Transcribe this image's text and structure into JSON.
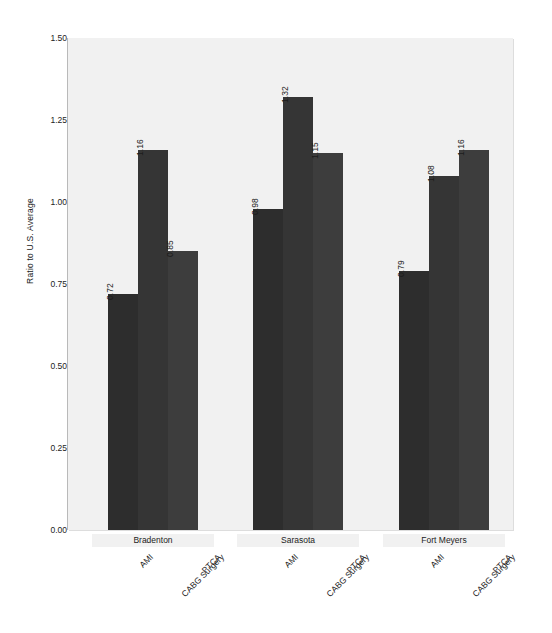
{
  "chart_data": {
    "type": "bar",
    "title": "",
    "xlabel": "",
    "ylabel": "Ratio to U.S. Average",
    "ylim": [
      0.0,
      1.5
    ],
    "ytick_labels": [
      "0.00",
      "0.25",
      "0.50",
      "0.75",
      "1.00",
      "1.25",
      "1.50"
    ],
    "ytick_values": [
      0.0,
      0.25,
      0.5,
      0.75,
      1.0,
      1.25,
      1.5
    ],
    "grid": false,
    "legend": "none",
    "categories": [
      "AMI",
      "CABG Surgery",
      "PTCA"
    ],
    "groups": [
      "Bradenton",
      "Sarasota",
      "Fort Meyers"
    ],
    "series": [
      {
        "name": "AMI",
        "values": [
          0.72,
          0.98,
          0.79
        ],
        "labels": [
          "0.72",
          "0.98",
          "0.79"
        ],
        "color": "#2d2d2d"
      },
      {
        "name": "CABG Surgery",
        "values": [
          1.16,
          1.32,
          1.08
        ],
        "labels": [
          "1.16",
          "1.32",
          "1.08"
        ],
        "color": "#353535"
      },
      {
        "name": "PTCA",
        "values": [
          0.85,
          1.15,
          1.16
        ],
        "labels": [
          "0.85",
          "1.15",
          "1.16"
        ],
        "color": "#3d3d3d"
      }
    ],
    "plot_background": "#f1f1f1",
    "axis_color": "#9a9a9a",
    "text_color": "#1c1c1c"
  }
}
